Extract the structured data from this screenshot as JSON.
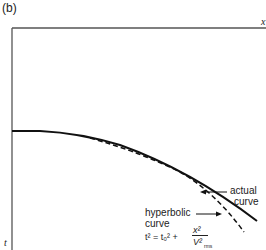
{
  "panel_label": "(b)",
  "axes": {
    "x_label": "x",
    "y_label": "t"
  },
  "annotations": {
    "actual_line1": "actual",
    "actual_line2": "curve",
    "hyper_line1": "hyperbolic",
    "hyper_line2": "curve",
    "formula_lhs": "t² = t₀² + ",
    "formula_num": "x²",
    "formula_den": "V²",
    "formula_sub": "rms"
  },
  "colors": {
    "line": "#111111",
    "axis": "#555555"
  }
}
